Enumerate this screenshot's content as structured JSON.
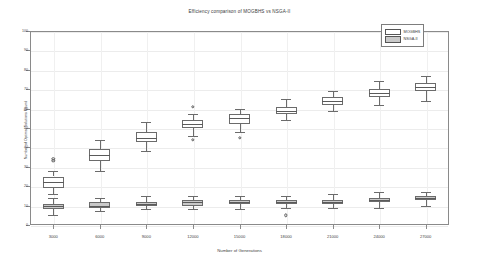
{
  "chart_data": {
    "type": "box",
    "title": "Efficiency comparison of MOGBHS vs NSGA-II",
    "xlabel": "Number of Generations",
    "ylabel": "Number of Optimal Solutions Found",
    "categories": [
      "3000",
      "6000",
      "9000",
      "12000",
      "15000",
      "18000",
      "21000",
      "24000",
      "27000"
    ],
    "ylim": [
      0,
      100
    ],
    "yticks": [
      0,
      10,
      20,
      30,
      40,
      50,
      60,
      70,
      80,
      90,
      100
    ],
    "grid": true,
    "legend_position": "top-right",
    "series": [
      {
        "name": "MOGBHS",
        "color": "#ffffff",
        "boxes": [
          {
            "category": "3000",
            "whisker_low": 16,
            "q1": 19,
            "median": 22,
            "q3": 25,
            "whisker_high": 28,
            "outliers": [
              33,
              34
            ]
          },
          {
            "category": "6000",
            "whisker_low": 28,
            "q1": 33,
            "median": 36,
            "q3": 39,
            "whisker_high": 44,
            "outliers": []
          },
          {
            "category": "9000",
            "whisker_low": 38,
            "q1": 43,
            "median": 45,
            "q3": 48,
            "whisker_high": 53,
            "outliers": []
          },
          {
            "category": "12000",
            "whisker_low": 46,
            "q1": 50,
            "median": 52,
            "q3": 54,
            "whisker_high": 57,
            "outliers": [
              61,
              44
            ]
          },
          {
            "category": "15000",
            "whisker_low": 48,
            "q1": 52,
            "median": 55,
            "q3": 57,
            "whisker_high": 60,
            "outliers": [
              45
            ]
          },
          {
            "category": "18000",
            "whisker_low": 54,
            "q1": 57,
            "median": 59,
            "q3": 61,
            "whisker_high": 65,
            "outliers": []
          },
          {
            "category": "21000",
            "whisker_low": 59,
            "q1": 62,
            "median": 64,
            "q3": 66,
            "whisker_high": 69,
            "outliers": []
          },
          {
            "category": "24000",
            "whisker_low": 62,
            "q1": 66,
            "median": 68,
            "q3": 70,
            "whisker_high": 74,
            "outliers": []
          },
          {
            "category": "27000",
            "whisker_low": 64,
            "q1": 69,
            "median": 71,
            "q3": 73,
            "whisker_high": 77,
            "outliers": []
          }
        ]
      },
      {
        "name": "NSGA-II",
        "color": "#c9c9c9",
        "boxes": [
          {
            "category": "3000",
            "whisker_low": 5,
            "q1": 8,
            "median": 10,
            "q3": 11,
            "whisker_high": 14,
            "outliers": []
          },
          {
            "category": "6000",
            "whisker_low": 7,
            "q1": 9,
            "median": 10,
            "q3": 12,
            "whisker_high": 14,
            "outliers": []
          },
          {
            "category": "9000",
            "whisker_low": 8,
            "q1": 10,
            "median": 11,
            "q3": 12,
            "whisker_high": 15,
            "outliers": []
          },
          {
            "category": "12000",
            "whisker_low": 8,
            "q1": 10,
            "median": 12,
            "q3": 13,
            "whisker_high": 15,
            "outliers": []
          },
          {
            "category": "15000",
            "whisker_low": 8,
            "q1": 11,
            "median": 12,
            "q3": 13,
            "whisker_high": 15,
            "outliers": []
          },
          {
            "category": "18000",
            "whisker_low": 9,
            "q1": 11,
            "median": 12,
            "q3": 13,
            "whisker_high": 15,
            "outliers": [
              5
            ]
          },
          {
            "category": "21000",
            "whisker_low": 9,
            "q1": 11,
            "median": 12,
            "q3": 13,
            "whisker_high": 16,
            "outliers": []
          },
          {
            "category": "24000",
            "whisker_low": 9,
            "q1": 12,
            "median": 13,
            "q3": 14,
            "whisker_high": 17,
            "outliers": []
          },
          {
            "category": "27000",
            "whisker_low": 10,
            "q1": 13,
            "median": 14,
            "q3": 15,
            "whisker_high": 17,
            "outliers": []
          }
        ]
      }
    ]
  }
}
